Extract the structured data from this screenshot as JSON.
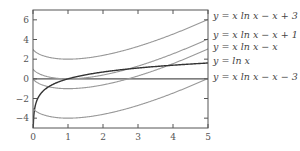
{
  "chart_data": {
    "type": "line",
    "title": "",
    "xlabel": "",
    "ylabel": "",
    "xlim": [
      0,
      5
    ],
    "ylim": [
      -5,
      7
    ],
    "xticks": [
      0,
      1,
      2,
      3,
      4,
      5
    ],
    "yticks": [
      -4,
      -2,
      0,
      2,
      4,
      6
    ],
    "grid": false,
    "legend_position": "right (inline labels at line ends)",
    "series": [
      {
        "name": "y = x ln x − x + 3",
        "formula": "x*ln(x)-x+3",
        "color": "#999999",
        "x": [
          0,
          0.5,
          1,
          2,
          3,
          4,
          5
        ],
        "values": [
          3,
          2.15,
          2,
          2.39,
          3.3,
          4.55,
          6.05
        ]
      },
      {
        "name": "y = x ln x − x + 1",
        "formula": "x*ln(x)-x+1",
        "color": "#999999",
        "x": [
          0,
          0.5,
          1,
          2,
          3,
          4,
          5
        ],
        "values": [
          1,
          0.15,
          0,
          0.39,
          1.3,
          2.55,
          4.05
        ]
      },
      {
        "name": "y = x ln x − x",
        "formula": "x*ln(x)-x",
        "color": "#999999",
        "x": [
          0,
          0.5,
          1,
          2,
          3,
          4,
          5
        ],
        "values": [
          0,
          -0.85,
          -1,
          -0.61,
          0.3,
          1.55,
          3.05
        ]
      },
      {
        "name": "y = ln x",
        "formula": "ln(x)",
        "color": "#333333",
        "x": [
          0.01,
          0.25,
          0.5,
          1,
          2,
          3,
          4,
          5
        ],
        "values": [
          -4.6,
          -1.39,
          -0.69,
          0,
          0.69,
          1.1,
          1.39,
          1.61
        ]
      },
      {
        "name": "y = x ln x − x − 3",
        "formula": "x*ln(x)-x-3",
        "color": "#999999",
        "x": [
          0,
          0.5,
          1,
          2,
          3,
          4,
          5
        ],
        "values": [
          -3,
          -3.85,
          -4,
          -3.61,
          -2.7,
          -1.45,
          0.05
        ]
      }
    ],
    "reference_lines": [
      {
        "y": 0,
        "color": "#555555"
      }
    ]
  },
  "axes": {
    "x_tick_labels": [
      "0",
      "1",
      "2",
      "3",
      "4",
      "5"
    ],
    "y_tick_labels": [
      "−4",
      "−2",
      "0",
      "2",
      "4",
      "6"
    ]
  },
  "legend": {
    "labels": [
      "y = x ln x − x + 3",
      "y = x ln x − x + 1",
      "y = x ln x − x",
      "y = ln x",
      "y = x ln x − x − 3"
    ]
  }
}
